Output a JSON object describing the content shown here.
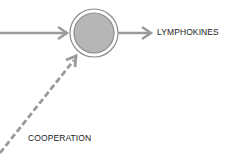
{
  "diagram": {
    "nodes": [
      {
        "id": "cell",
        "shape": "double-circle",
        "fill": "#b4b4b4",
        "stroke": "#8c8c8c"
      }
    ],
    "edges": [
      {
        "from": "left-input",
        "to": "cell",
        "style": "solid",
        "color": "#9a9a9a"
      },
      {
        "from": "cell",
        "to": "lymphokines",
        "style": "solid",
        "color": "#9a9a9a"
      },
      {
        "from": "cooperation",
        "to": "cell",
        "style": "dashed",
        "color": "#9a9a9a"
      }
    ],
    "labels": {
      "output": "LYMPHOKINES",
      "cooperation": "COOPERATION"
    }
  }
}
